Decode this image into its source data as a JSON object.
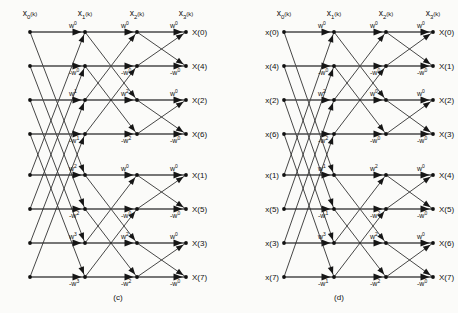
{
  "figure": {
    "title_hidden": "",
    "panels": [
      {
        "id": "c",
        "caption": "(c)",
        "stage_labels": [
          {
            "base": "x",
            "sub": "0",
            "arg": "(k)"
          },
          {
            "base": "x",
            "sub": "1",
            "arg": "(k)"
          },
          {
            "base": "x",
            "sub": "2",
            "arg": "(k)"
          },
          {
            "base": "x",
            "sub": "3",
            "arg": "(k)"
          }
        ],
        "inputs": [
          "",
          "",
          "",
          "",
          "",
          "",
          "",
          ""
        ],
        "outputs": [
          "X(0)",
          "X(4)",
          "X(2)",
          "X(6)",
          "X(1)",
          "X(5)",
          "X(3)",
          "X(7)"
        ],
        "stage1_weights": [
          "",
          "",
          "",
          "",
          "",
          "",
          "",
          "",
          "w0",
          "-w0",
          "w1",
          "-w1",
          "w2",
          "-w2",
          "w3",
          "-w3"
        ],
        "stage2_weights": [
          "w0",
          "-w0",
          "w2",
          "-w2",
          "w0",
          "-w0",
          "w2",
          "-w2"
        ],
        "stage3_weights": [
          "w0",
          "-w0",
          "w0",
          "-w0",
          "w0",
          "-w0",
          "w0",
          "-w0"
        ]
      },
      {
        "id": "d",
        "caption": "(d)",
        "stage_labels": [
          {
            "base": "x",
            "sub": "0",
            "arg": "(k)"
          },
          {
            "base": "x",
            "sub": "1",
            "arg": "(k)"
          },
          {
            "base": "x",
            "sub": "2",
            "arg": "(k)"
          },
          {
            "base": "x",
            "sub": "3",
            "arg": "(k)"
          }
        ],
        "inputs": [
          "x(0)",
          "x(4)",
          "x(2)",
          "x(6)",
          "x(1)",
          "x(5)",
          "x(3)",
          "x(7)"
        ],
        "outputs": [
          "X(0)",
          "X(1)",
          "X(2)",
          "X(3)",
          "X(4)",
          "X(5)",
          "X(6)",
          "X(7)"
        ],
        "stage1_weights": [
          "w0",
          "-w0",
          "w2",
          "-w2",
          "w1",
          "-w1",
          "w3",
          "-w1"
        ],
        "stage2_weights": [
          "w0",
          "-w0",
          "w0",
          "-w0",
          "w2",
          "-w2",
          "w2",
          "-w2"
        ],
        "stage3_weights": [
          "w0",
          "-w0",
          "w0",
          "-w0",
          "w0",
          "-w0",
          "w0",
          "-w0"
        ]
      }
    ],
    "weight_symbols": [
      "w0",
      "-w0",
      "w1",
      "-w1",
      "w2",
      "-w2",
      "w3",
      "-w3"
    ],
    "row_count": 8,
    "stage_count": 4,
    "colors": {
      "ink": "#111111",
      "edge": "#222222",
      "background": "#fbfbf9"
    }
  }
}
